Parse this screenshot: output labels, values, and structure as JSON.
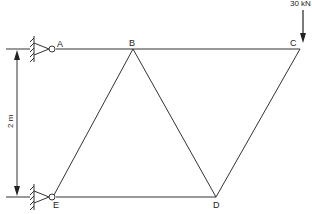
{
  "diagram": {
    "type": "truss",
    "nodes": [
      {
        "id": "A",
        "label": "A",
        "x": 52,
        "y": 49,
        "support": "pin"
      },
      {
        "id": "B",
        "label": "B",
        "x": 133,
        "y": 49
      },
      {
        "id": "C",
        "label": "C",
        "x": 300,
        "y": 49
      },
      {
        "id": "D",
        "label": "D",
        "x": 216,
        "y": 197
      },
      {
        "id": "E",
        "label": "E",
        "x": 52,
        "y": 197,
        "support": "pin"
      }
    ],
    "members": [
      [
        "A",
        "B"
      ],
      [
        "B",
        "C"
      ],
      [
        "B",
        "E"
      ],
      [
        "B",
        "D"
      ],
      [
        "C",
        "D"
      ],
      [
        "E",
        "D"
      ]
    ],
    "load": {
      "node": "C",
      "label": "30 kN",
      "direction": "down"
    },
    "dimension": {
      "label": "2 m",
      "from": "A",
      "to": "E"
    },
    "colors": {
      "line": "#333333",
      "background": "#ffffff"
    }
  }
}
